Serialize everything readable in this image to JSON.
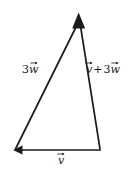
{
  "figure": {
    "type": "vector-triangle-diagram",
    "title": "",
    "background_color": "#ffffff",
    "stroke_color": "#1a1a1a",
    "stroke_width": 1.6,
    "width": 138,
    "height": 173,
    "vertices": {
      "apex": {
        "name": "apex",
        "x": 79,
        "y": 19
      },
      "bottom_left": {
        "name": "bottom-left",
        "x": 14,
        "y": 150
      },
      "bottom_right": {
        "name": "bottom-right",
        "x": 100,
        "y": 150
      }
    },
    "vectors": [
      {
        "id": "three-w",
        "label_text": "3w",
        "coefficient": "3",
        "symbol": "w",
        "has_vector_arrow": true,
        "from": "bottom_left",
        "to": "apex",
        "arrowhead_at": "apex",
        "label_x": 22,
        "label_y": 64
      },
      {
        "id": "v-plus-three-w",
        "label_text": "v + 3w",
        "left_symbol": "v",
        "operator": "+",
        "coefficient": "3",
        "right_symbol": "w",
        "has_vector_arrow": true,
        "from": "bottom_right",
        "to": "apex",
        "arrowhead_at": "apex",
        "label_x": 86,
        "label_y": 64
      },
      {
        "id": "v",
        "label_text": "v",
        "symbol": "v",
        "has_vector_arrow": true,
        "from": "bottom_right",
        "to": "bottom_left",
        "arrowhead_at": "bottom_left",
        "label_x": 58,
        "label_y": 155
      }
    ],
    "arrowheads": [
      {
        "name": "apex-arrowhead",
        "x": 79,
        "y": 19,
        "direction": "up"
      },
      {
        "name": "baseline-arrowhead",
        "x": 14,
        "y": 150,
        "direction": "left"
      }
    ]
  }
}
